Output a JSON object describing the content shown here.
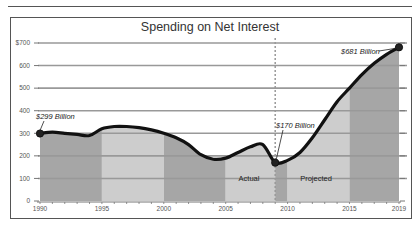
{
  "chart_data": {
    "type": "area",
    "title": "Spending on Net Interest",
    "xlabel": "",
    "ylabel": "",
    "ylim": [
      0,
      700
    ],
    "xlim": [
      1990,
      2019
    ],
    "y_ticks": [
      "0",
      "100",
      "200",
      "300",
      "400",
      "500",
      "600",
      "$700"
    ],
    "x_ticks": [
      "1990",
      "1995",
      "2000",
      "2005",
      "2010",
      "2015",
      "2019"
    ],
    "grid": true,
    "series": [
      {
        "name": "Net Interest Spending ($ Billion)",
        "x": [
          1990,
          1991,
          1992,
          1993,
          1994,
          1995,
          1996,
          1997,
          1998,
          1999,
          2000,
          2001,
          2002,
          2003,
          2004,
          2005,
          2006,
          2007,
          2008,
          2009,
          2010,
          2011,
          2012,
          2013,
          2014,
          2015,
          2016,
          2017,
          2018,
          2019
        ],
        "values": [
          299,
          305,
          300,
          295,
          290,
          320,
          330,
          330,
          325,
          315,
          300,
          280,
          250,
          205,
          185,
          190,
          215,
          240,
          250,
          170,
          180,
          215,
          280,
          360,
          440,
          500,
          560,
          610,
          650,
          681
        ]
      }
    ],
    "regions": [
      {
        "label": "Actual",
        "from": 1990,
        "to": 2009
      },
      {
        "label": "Projected",
        "from": 2009,
        "to": 2019
      }
    ],
    "divider_year": 2009,
    "annotations": [
      {
        "text": "$299 Billion",
        "x": 1990,
        "y": 299
      },
      {
        "text": "$170 Billion",
        "x": 2009,
        "y": 170
      },
      {
        "text": "$681 Billion",
        "x": 2019,
        "y": 681
      }
    ],
    "colors": {
      "band_dark": "#a6a6a6",
      "band_light": "#cdcdcd",
      "line": "#111111",
      "grid": "#999999"
    }
  }
}
